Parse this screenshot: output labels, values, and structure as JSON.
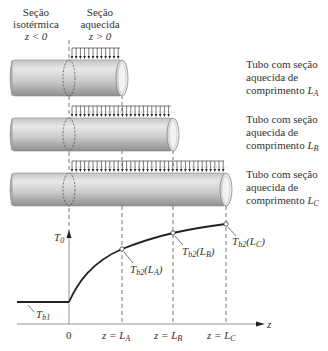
{
  "section_labels": {
    "isothermal": {
      "line1": "Seção",
      "line2": "isotérmica",
      "line3": "z < 0"
    },
    "heated": {
      "line1": "Seção",
      "line2": "aquecida",
      "line3": "z > 0"
    }
  },
  "tubes": [
    {
      "id": "A",
      "line1": "Tubo com seção",
      "line2": "aquecida de",
      "line3_prefix": "comprimento ",
      "length_symbol": "L",
      "length_sub": "A"
    },
    {
      "id": "B",
      "line1": "Tubo com seção",
      "line2": "aquecida de",
      "line3_prefix": "comprimento ",
      "length_symbol": "L",
      "length_sub": "B"
    },
    {
      "id": "C",
      "line1": "Tubo com seção",
      "line2": "aquecida de",
      "line3_prefix": "comprimento ",
      "length_symbol": "L",
      "length_sub": "C"
    }
  ],
  "graph": {
    "y_axis_label": "T",
    "y_axis_sub": "0",
    "x_axis_label": "z",
    "inlet_temp": {
      "symbol": "T",
      "sub": "b1"
    },
    "outlet_points": [
      {
        "symbol": "T",
        "sub": "b2",
        "arg": "(L",
        "arg_sub": "A",
        "close": ")"
      },
      {
        "symbol": "T",
        "sub": "b2",
        "arg": "(L",
        "arg_sub": "B",
        "close": ")"
      },
      {
        "symbol": "T",
        "sub": "b2",
        "arg": "(L",
        "arg_sub": "C",
        "close": ")"
      }
    ],
    "x_ticks": [
      {
        "label": "0"
      },
      {
        "prefix": "z = ",
        "symbol": "L",
        "sub": "A"
      },
      {
        "prefix": "z = ",
        "symbol": "L",
        "sub": "B"
      },
      {
        "prefix": "z = ",
        "symbol": "L",
        "sub": "C"
      }
    ]
  },
  "colors": {
    "tube_light": "#e6e6e6",
    "tube_mid": "#b5b5b5",
    "tube_dark": "#8c8c8c",
    "line": "#222222",
    "dash": "#555555"
  }
}
